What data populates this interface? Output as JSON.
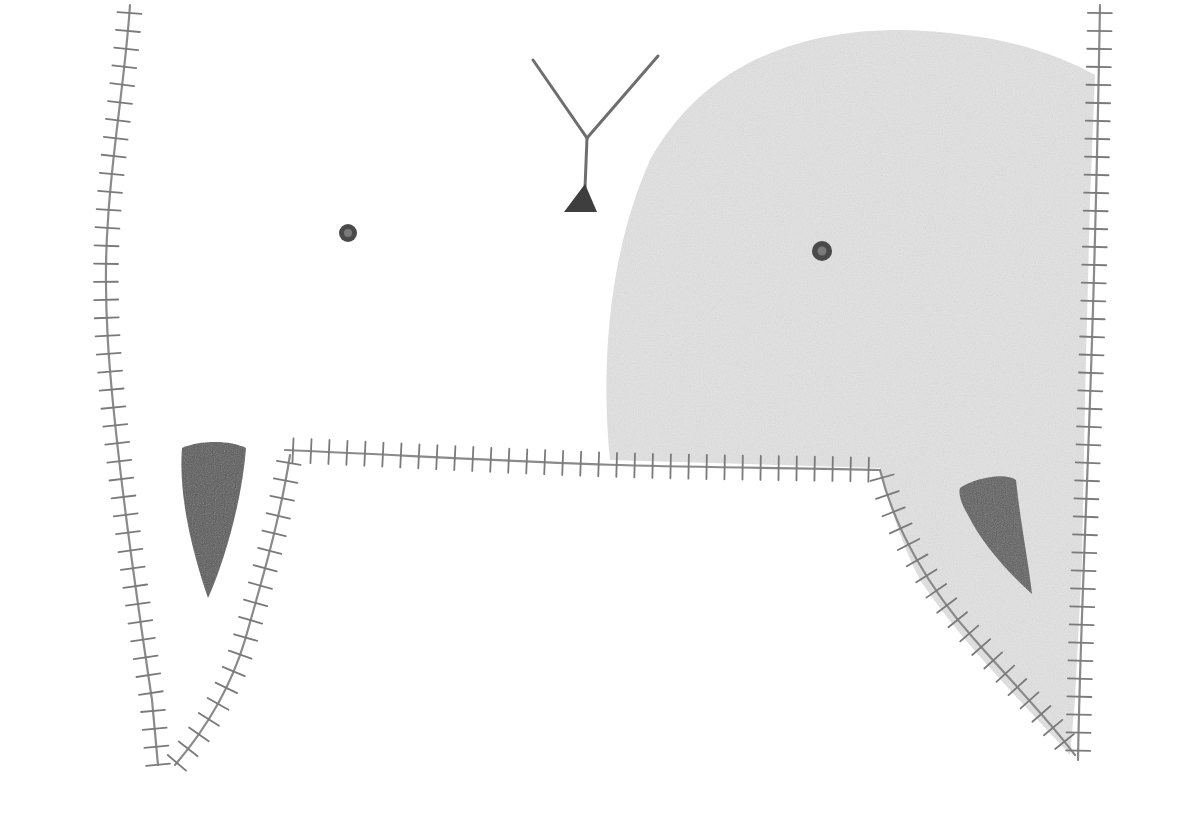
{
  "artwork": {
    "medium": "pencil drawing",
    "colors": {
      "paper": "#ffffff",
      "shade": "#e4e4e4",
      "line": "#8a8a8a",
      "dark": "#4a4a4a"
    },
    "elements": [
      "left-stitched-seam",
      "right-stitched-seam",
      "horizontal-stitched-seam",
      "shaded-head-shape",
      "y-shaped-figure",
      "left-eye-dot",
      "right-eye-dot",
      "left-dark-tooth",
      "right-dark-tooth"
    ]
  }
}
